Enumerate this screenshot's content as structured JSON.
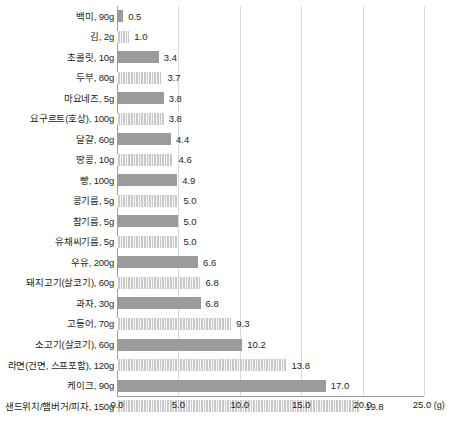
{
  "chart_data": {
    "type": "bar",
    "orientation": "horizontal",
    "title": "",
    "subtitle": "",
    "xlabel": "(g)",
    "ylabel": "",
    "xlim": [
      0.0,
      25.0
    ],
    "xticks": [
      "0.0",
      "5.0",
      "10.0",
      "15.0",
      "20.0",
      "25.0"
    ],
    "xtick_values": [
      0,
      5,
      10,
      15,
      20,
      25
    ],
    "unit_suffix": "(g)",
    "grid": "vertical",
    "legend": "none",
    "categories": [
      "백미, 90g",
      "김, 2g",
      "초콜릿, 10g",
      "두부, 80g",
      "마요네즈, 5g",
      "요구르트(호상), 100g",
      "달걀, 60g",
      "땅콩, 10g",
      "빵, 100g",
      "콩기름, 5g",
      "참기름, 5g",
      "유채씨기름, 5g",
      "우유, 200g",
      "돼지고기(살코기), 60g",
      "과자, 30g",
      "고등어, 70g",
      "소고기(살코기), 60g",
      "라면(건면, 스프포함), 120g",
      "케이크, 90g",
      "샌드위치/햄버거/피자, 150g"
    ],
    "values": [
      0.5,
      1.0,
      3.4,
      3.7,
      3.8,
      3.8,
      4.4,
      4.6,
      4.9,
      5.0,
      5.0,
      5.0,
      6.6,
      6.8,
      6.8,
      9.3,
      10.2,
      13.8,
      17.0,
      19.8
    ],
    "value_labels": [
      "0.5",
      "1.0",
      "3.4",
      "3.7",
      "3.8",
      "3.8",
      "4.4",
      "4.6",
      "4.9",
      "5.0",
      "5.0",
      "5.0",
      "6.6",
      "6.8",
      "6.8",
      "9.3",
      "10.2",
      "13.8",
      "17.0",
      "19.8"
    ],
    "bar_styles": [
      "dark",
      "striped",
      "dark",
      "striped",
      "dark",
      "striped",
      "dark",
      "striped",
      "dark",
      "striped",
      "dark",
      "striped",
      "dark",
      "striped",
      "dark",
      "striped",
      "dark",
      "striped",
      "dark",
      "striped"
    ],
    "colors": {
      "bar_dark": "#9b9b9b",
      "bar_light": "#c9c9c9",
      "gridline": "#d9d9d9",
      "axis": "#9e9e9e",
      "text": "#231f20",
      "background": "#ffffff"
    }
  }
}
